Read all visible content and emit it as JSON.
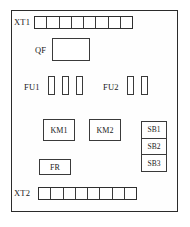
{
  "diagram": {
    "frame": {
      "name": "control-cabinet-enclosure"
    },
    "terminals": [
      {
        "id": "XT1",
        "label": "XT1",
        "cells": 8,
        "position": "top"
      },
      {
        "id": "XT2",
        "label": "XT2",
        "cells": 8,
        "position": "bottom"
      }
    ],
    "breaker": {
      "id": "QF",
      "label": "QF"
    },
    "fuse_groups": [
      {
        "id": "FU1",
        "label": "FU1",
        "count": 3
      },
      {
        "id": "FU2",
        "label": "FU2",
        "count": 2
      }
    ],
    "contactors": [
      {
        "id": "KM1",
        "label": "KM1"
      },
      {
        "id": "KM2",
        "label": "KM2"
      }
    ],
    "relay": {
      "id": "FR",
      "label": "FR"
    },
    "pushbuttons": [
      {
        "id": "SB1",
        "label": "SB1"
      },
      {
        "id": "SB2",
        "label": "SB2"
      },
      {
        "id": "SB3",
        "label": "SB3"
      }
    ],
    "colors": {
      "line": "#3a3a3a",
      "frame": "#2b2b2b",
      "background": "#ffffff",
      "text": "#1a1a1a"
    }
  }
}
